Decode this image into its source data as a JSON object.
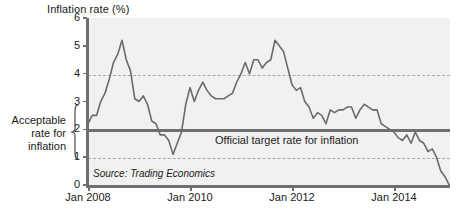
{
  "chart_data": {
    "type": "line",
    "title": "Inflation rate (%)",
    "xlabel": "",
    "ylabel": "Inflation rate (%)",
    "ylim": [
      0,
      6
    ],
    "xlim": [
      "Jan 2008",
      "Jul 2015"
    ],
    "grid": false,
    "legend_position": "none",
    "y_ticks": [
      "0",
      "1",
      "2",
      "3",
      "4",
      "5",
      "6"
    ],
    "x_ticks": [
      "Jan 2008",
      "Jan 2010",
      "Jan 2012",
      "Jan 2014"
    ],
    "source": "Source: Trading Economics",
    "annotations": [
      {
        "name": "target-rate",
        "text": "Official target rate for inflation",
        "value": 2
      },
      {
        "name": "acceptable-band",
        "text": "Acceptable rate for inflation",
        "lower": 1,
        "upper": 3
      }
    ],
    "reference_lines": [
      {
        "name": "upper-band",
        "value": 3,
        "style": "dashed"
      },
      {
        "name": "target",
        "value": 2,
        "style": "solid"
      },
      {
        "name": "lower-band",
        "value": 1,
        "style": "dashed"
      }
    ],
    "series": [
      {
        "name": "Inflation rate",
        "color": "#6b6b6b",
        "x": [
          "2008-01",
          "2008-02",
          "2008-03",
          "2008-04",
          "2008-05",
          "2008-06",
          "2008-07",
          "2008-08",
          "2008-09",
          "2008-10",
          "2008-11",
          "2008-12",
          "2009-01",
          "2009-02",
          "2009-03",
          "2009-04",
          "2009-05",
          "2009-06",
          "2009-07",
          "2009-08",
          "2009-09",
          "2009-10",
          "2009-11",
          "2009-12",
          "2010-01",
          "2010-02",
          "2010-03",
          "2010-04",
          "2010-05",
          "2010-06",
          "2010-07",
          "2010-08",
          "2010-09",
          "2010-10",
          "2010-11",
          "2010-12",
          "2011-01",
          "2011-02",
          "2011-03",
          "2011-04",
          "2011-05",
          "2011-06",
          "2011-07",
          "2011-08",
          "2011-09",
          "2011-10",
          "2011-11",
          "2011-12",
          "2012-01",
          "2012-02",
          "2012-03",
          "2012-04",
          "2012-05",
          "2012-06",
          "2012-07",
          "2012-08",
          "2012-09",
          "2012-10",
          "2012-11",
          "2012-12",
          "2013-01",
          "2013-02",
          "2013-03",
          "2013-04",
          "2013-05",
          "2013-06",
          "2013-07",
          "2013-08",
          "2013-09",
          "2013-10",
          "2013-11",
          "2013-12",
          "2014-01",
          "2014-02",
          "2014-03",
          "2014-04",
          "2014-05",
          "2014-06",
          "2014-07",
          "2014-08",
          "2014-09",
          "2014-10",
          "2014-11",
          "2014-12",
          "2015-01",
          "2015-02",
          "2015-03",
          "2015-04"
        ],
        "values": [
          2.2,
          2.5,
          2.5,
          3.0,
          3.3,
          3.8,
          4.4,
          4.7,
          5.2,
          4.5,
          4.1,
          3.1,
          3.0,
          3.2,
          2.9,
          2.3,
          2.2,
          1.8,
          1.8,
          1.6,
          1.1,
          1.5,
          1.9,
          2.9,
          3.5,
          3.0,
          3.4,
          3.7,
          3.4,
          3.2,
          3.1,
          3.1,
          3.1,
          3.2,
          3.3,
          3.7,
          4.0,
          4.4,
          4.0,
          4.5,
          4.5,
          4.2,
          4.4,
          4.5,
          5.2,
          5.0,
          4.8,
          4.2,
          3.6,
          3.4,
          3.5,
          3.0,
          2.8,
          2.4,
          2.6,
          2.5,
          2.2,
          2.7,
          2.6,
          2.7,
          2.7,
          2.8,
          2.8,
          2.4,
          2.7,
          2.9,
          2.8,
          2.7,
          2.7,
          2.2,
          2.1,
          2.0,
          1.9,
          1.7,
          1.6,
          1.8,
          1.5,
          1.9,
          1.6,
          1.5,
          1.2,
          1.3,
          1.0,
          0.5,
          0.3,
          0.0,
          0.0,
          -0.1
        ]
      }
    ]
  },
  "chart": {
    "title": "Inflation rate (%)",
    "source": "Source: Trading Economics",
    "target_label": "Official target rate for inflation",
    "band_label_line1": "Acceptable",
    "band_label_line2": "rate for",
    "band_label_line3": "inflation",
    "y_ticks": [
      "6",
      "5",
      "4",
      "3",
      "2",
      "1",
      "0"
    ],
    "x_ticks": [
      {
        "label": "Jan 2008",
        "pos": 88
      },
      {
        "label": "Jan 2010",
        "pos": 190
      },
      {
        "label": "Jan 2012",
        "pos": 292
      },
      {
        "label": "Jan 2014",
        "pos": 394
      }
    ],
    "colors": {
      "plot_background": "#f1f1f1",
      "axis": "#6f6f6f",
      "data_line": "#6b6b6b",
      "band_dashed": "#a9a9a9",
      "text": "#1a1a1a"
    }
  }
}
